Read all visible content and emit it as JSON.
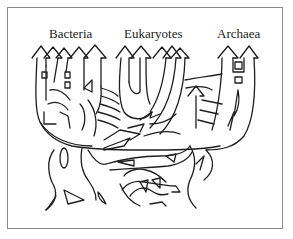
{
  "diagram": {
    "type": "tree-of-life",
    "labels": {
      "bacteria": "Bacteria",
      "eukaryotes": "Eukaryotes",
      "archaea": "Archaea"
    },
    "colors": {
      "line": "#1e1e1e",
      "background": "#ffffff",
      "frame": "#8a8a8a"
    }
  }
}
